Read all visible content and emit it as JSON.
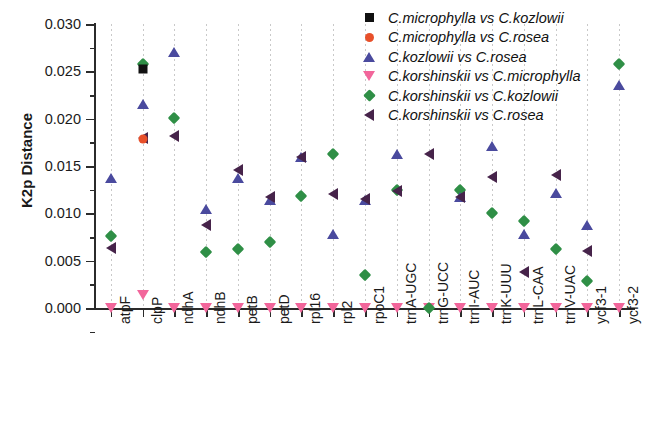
{
  "chart_data": {
    "type": "scatter",
    "title": "",
    "xlabel": "",
    "ylabel": "K2p Distance",
    "ylim": [
      0.0,
      0.03
    ],
    "yticks": [
      "0.000",
      "0.005",
      "0.010",
      "0.015",
      "0.020",
      "0.025",
      "0.030"
    ],
    "ytick_values": [
      0.0,
      0.005,
      0.01,
      0.015,
      0.02,
      0.025,
      0.03
    ],
    "grid": "vertical-dashed",
    "legend_position": "top-right",
    "categories": [
      "atpF",
      "clpP",
      "ndhA",
      "ndhB",
      "petB",
      "petD",
      "rpl16",
      "rpl2",
      "rpoC1",
      "trnA-UGC",
      "trnG-UCC",
      "trnI-AUC",
      "trnK-UUU",
      "trnL-CAA",
      "trnV-UAC",
      "ycf3-1",
      "ycf3-2"
    ],
    "series": [
      {
        "name": "C.microphylla vs C.kozlowii",
        "marker": "square",
        "color": "#111111",
        "values": [
          null,
          0.0252,
          null,
          null,
          null,
          null,
          null,
          null,
          null,
          null,
          null,
          null,
          null,
          null,
          null,
          null,
          null
        ]
      },
      {
        "name": "C.microphylla vs C.rosea",
        "marker": "circle",
        "color": "#e8502a",
        "values": [
          null,
          0.0179,
          null,
          null,
          null,
          null,
          null,
          null,
          null,
          null,
          null,
          null,
          null,
          null,
          null,
          null,
          null
        ]
      },
      {
        "name": "C.kozlowii vs C.rosea",
        "marker": "triangle-up",
        "color": "#4a4a9e",
        "values": [
          0.0137,
          0.0215,
          0.027,
          0.0105,
          0.0137,
          0.0114,
          0.016,
          0.0078,
          0.0114,
          0.0163,
          null,
          0.0117,
          0.0171,
          0.0078,
          0.0122,
          0.0088,
          0.0236
        ]
      },
      {
        "name": "C.korshinskii vs C.microphylla",
        "marker": "triangle-down",
        "color": "#f2669b",
        "values": [
          0.0,
          0.0014,
          0.0,
          0.0,
          0.0,
          0.0,
          0.0,
          0.0,
          0.0,
          0.0,
          0.0,
          0.0,
          0.0,
          0.0,
          0.0,
          0.0,
          0.0
        ]
      },
      {
        "name": "C.korshinskii vs C.kozlowii",
        "marker": "diamond",
        "color": "#2f8f46",
        "values": [
          0.0076,
          0.0258,
          0.0201,
          0.0059,
          0.0062,
          0.007,
          0.0118,
          0.0163,
          0.0035,
          0.0125,
          0.0,
          0.0125,
          0.01,
          0.0092,
          0.0062,
          0.0028,
          0.0258
        ]
      },
      {
        "name": "C.korshinskii vs C.rosea",
        "marker": "triangle-left",
        "color": "#46234a",
        "values": [
          0.0063,
          0.018,
          0.0182,
          0.0088,
          0.0146,
          0.0117,
          0.0159,
          0.012,
          0.0115,
          0.0124,
          0.0163,
          0.0117,
          0.0138,
          0.0038,
          0.014,
          0.006,
          null
        ]
      }
    ]
  }
}
